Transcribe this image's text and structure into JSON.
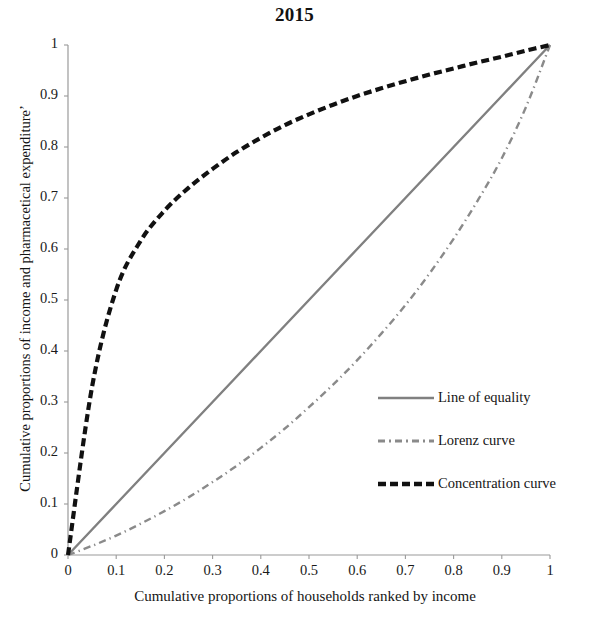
{
  "chart_data": {
    "type": "line",
    "title": "2015",
    "xlabel": "Cumulative  proportions of households ranked by income",
    "ylabel": "Cumulative proportions of income and pharmacetical expenditure’",
    "xlim": [
      0,
      1
    ],
    "ylim": [
      0,
      1
    ],
    "grid": false,
    "legend_position": "center-right",
    "xticks": [
      "0",
      "0.1",
      "0.2",
      "0.3",
      "0.4",
      "0.5",
      "0.6",
      "0.7",
      "0.8",
      "0.9",
      "1"
    ],
    "yticks": [
      "0",
      "0.1",
      "0.2",
      "0.3",
      "0.4",
      "0.5",
      "0.6",
      "0.7",
      "0.8",
      "0.9",
      "1"
    ],
    "x": [
      0,
      0.05,
      0.1,
      0.15,
      0.2,
      0.25,
      0.3,
      0.35,
      0.4,
      0.45,
      0.5,
      0.55,
      0.6,
      0.65,
      0.7,
      0.75,
      0.8,
      0.85,
      0.9,
      0.95,
      1
    ],
    "series": [
      {
        "name": "Line of equality",
        "style": "solid",
        "color": "#808080",
        "width": 2.4,
        "values": [
          0,
          0.05,
          0.1,
          0.15,
          0.2,
          0.25,
          0.3,
          0.35,
          0.4,
          0.45,
          0.5,
          0.55,
          0.6,
          0.65,
          0.7,
          0.75,
          0.8,
          0.85,
          0.9,
          0.95,
          1
        ]
      },
      {
        "name": "Lorenz curve",
        "style": "dashdot",
        "color": "#8a8a8a",
        "width": 2.4,
        "values": [
          0,
          0.018,
          0.038,
          0.061,
          0.086,
          0.113,
          0.143,
          0.175,
          0.21,
          0.248,
          0.29,
          0.334,
          0.382,
          0.434,
          0.49,
          0.552,
          0.62,
          0.695,
          0.778,
          0.878,
          1
        ]
      },
      {
        "name": "Concentration curve",
        "style": "dashed",
        "color": "#111111",
        "width": 4.2,
        "values": [
          0,
          0.33,
          0.52,
          0.615,
          0.675,
          0.72,
          0.757,
          0.79,
          0.818,
          0.843,
          0.864,
          0.883,
          0.9,
          0.915,
          0.929,
          0.942,
          0.954,
          0.966,
          0.977,
          0.989,
          1
        ]
      }
    ]
  },
  "legend": {
    "items": [
      {
        "label": "Line of equality"
      },
      {
        "label": "Lorenz curve"
      },
      {
        "label": "Concentration curve"
      }
    ]
  }
}
